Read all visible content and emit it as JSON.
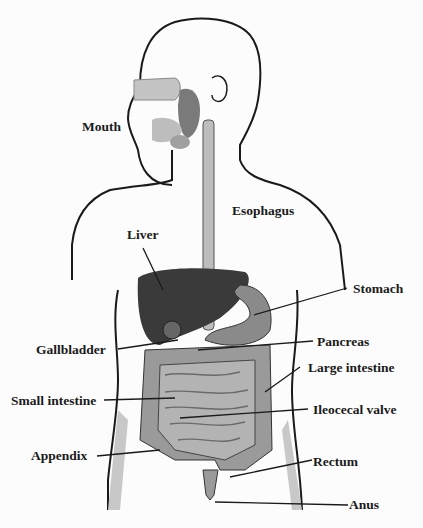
{
  "diagram": {
    "title_hidden": "",
    "labels": {
      "mouth": "Mouth",
      "esophagus": "Esophagus",
      "liver": "Liver",
      "stomach": "Stomach",
      "gallbladder": "Gallbladder",
      "pancreas": "Pancreas",
      "large_intestine": "Large intestine",
      "small_intestine": "Small intestine",
      "ileocecal_valve": "Ileocecal valve",
      "appendix": "Appendix",
      "rectum": "Rectum",
      "anus": "Anus"
    },
    "colors": {
      "outline": "#1a1a1a",
      "organ_dark": "#3a3a3a",
      "organ_mid": "#8a8a8a",
      "organ_light": "#bdbdbd",
      "shade": "#d0d0d0"
    }
  }
}
